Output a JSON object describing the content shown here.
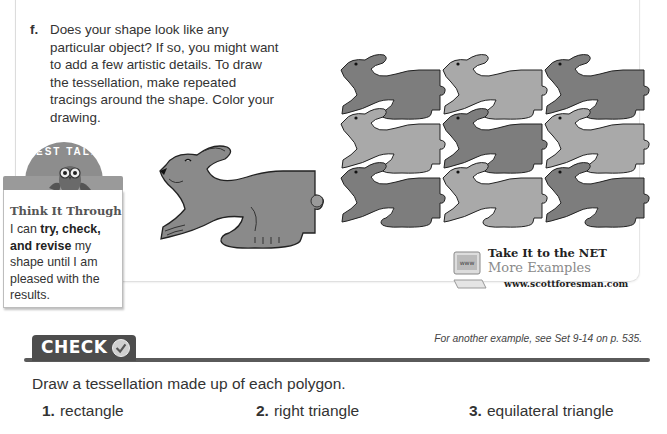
{
  "step": {
    "letter": "f.",
    "text": "Does your shape look like any particular object? If so, you might want to add a few artistic details. To draw the tessellation, make repeated tracings around the shape. Color your drawing."
  },
  "test_talk": {
    "arc_label": "TEST TALK",
    "title": "Think It Through",
    "text_pre": "I can ",
    "text_bold": "try, check, and revise",
    "text_post": " my shape until I am pleased with the results."
  },
  "figures": {
    "single_shape": "rabbit-shape",
    "tessellation": {
      "rows": 3,
      "cols": 3,
      "colors": [
        "#7d7d7d",
        "#a9a9a9"
      ]
    }
  },
  "net_link": {
    "line1": "Take It to the NET",
    "line2": "More Examples",
    "line3": "www.scottforesman.com",
    "icon": "www-monitor-icon",
    "icon_label": "www"
  },
  "check": {
    "label": "CHECK",
    "icon": "checkmark-icon",
    "reference": "For another example, see Set 9-14 on p. 535."
  },
  "instruction": "Draw a tessellation made up of each polygon.",
  "exercises": [
    {
      "number": "1.",
      "text": "rectangle"
    },
    {
      "number": "2.",
      "text": "right triangle"
    },
    {
      "number": "3.",
      "text": "equilateral triangle"
    }
  ],
  "colors": {
    "rabbit_dark": "#7d7d7d",
    "rabbit_light": "#a9a9a9",
    "check_band": "#4d4d4d"
  }
}
